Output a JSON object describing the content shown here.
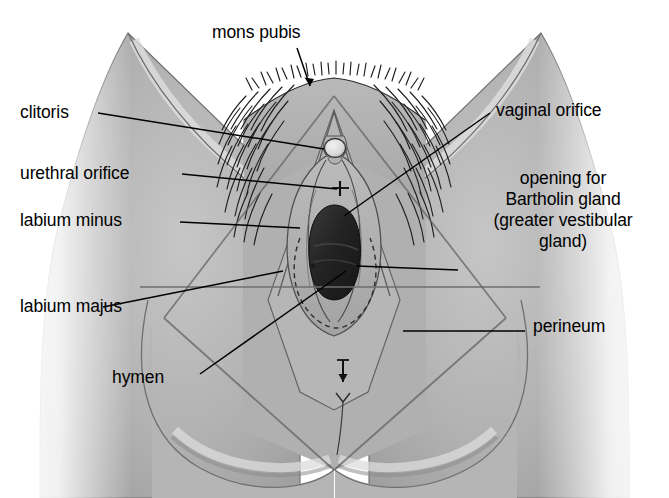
{
  "figure": {
    "style": "grayscale halftone medical illustration",
    "colors": {
      "background": "#ffffff",
      "skin_mid": "#adadad",
      "skin_light": "#c9c9c9",
      "skin_shadow": "#8f8f8f",
      "ink": "#000000",
      "orifice_dark": "#2b2b2b",
      "guide_line": "#6e6e6e"
    }
  },
  "labels": {
    "mons_pubis": "mons pubis",
    "clitoris": "clitoris",
    "urethral_orifice": "urethral orifice",
    "labium_minus": "labium minus",
    "labium_majus": "labium majus",
    "hymen": "hymen",
    "vaginal_orifice": "vaginal orifice",
    "perineum": "perineum",
    "bartholin_line1": "opening for",
    "bartholin_line2": "Bartholin gland",
    "bartholin_line3": "(greater vestibular",
    "bartholin_line4": "gland)"
  },
  "structures": [
    {
      "name": "mons-pubis",
      "note": "hair-covered mound above the pubic symphysis"
    },
    {
      "name": "clitoris",
      "note": "small rounded glans at apex of the vestibule"
    },
    {
      "name": "urethral-orifice",
      "note": "small opening below the clitoris"
    },
    {
      "name": "labium-minus",
      "note": "inner fold of the vulva"
    },
    {
      "name": "labium-majus",
      "note": "outer fold of the vulva"
    },
    {
      "name": "hymen",
      "note": "membranous ring bordering the vaginal orifice"
    },
    {
      "name": "vaginal-orifice",
      "note": "dark oval vaginal opening"
    },
    {
      "name": "bartholin-gland-opening",
      "note": "small duct opening lateral to the vaginal orifice"
    },
    {
      "name": "perineum",
      "note": "region between the vulva and anus"
    }
  ]
}
